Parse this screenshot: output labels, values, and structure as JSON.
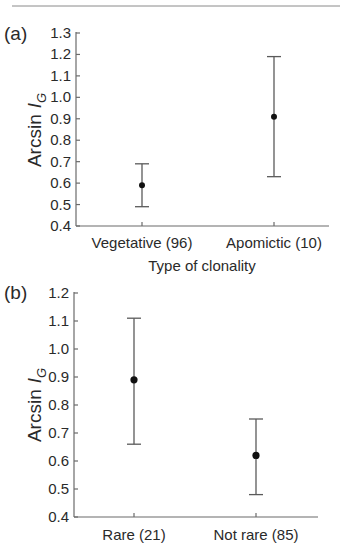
{
  "chart_data": [
    {
      "type": "scatter",
      "panel_label": "(a)",
      "title": "",
      "xlabel": "Type of clonality",
      "ylabel": "Arcsin",
      "ylabel_subscript_symbol": "I",
      "ylabel_subscript": "G",
      "categories": [
        "Vegetative (96)",
        "Apomictic (10)"
      ],
      "series": [
        {
          "name": "mean with interval",
          "values": [
            0.59,
            0.91
          ],
          "lower": [
            0.49,
            0.63
          ],
          "upper": [
            0.69,
            1.19
          ]
        }
      ],
      "ylim": [
        0.4,
        1.3
      ],
      "yticks": [
        "0.4",
        "0.5",
        "0.6",
        "0.7",
        "0.8",
        "0.9",
        "1.0",
        "1.1",
        "1.2",
        "1.3"
      ],
      "grid": false,
      "legend": "none"
    },
    {
      "type": "scatter",
      "panel_label": "(b)",
      "title": "",
      "xlabel": "",
      "ylabel": "Arcsin",
      "ylabel_subscript_symbol": "I",
      "ylabel_subscript": "G",
      "categories": [
        "Rare (21)",
        "Not rare (85)"
      ],
      "series": [
        {
          "name": "mean with interval",
          "values": [
            0.89,
            0.62
          ],
          "lower": [
            0.66,
            0.48
          ],
          "upper": [
            1.11,
            0.75
          ]
        }
      ],
      "ylim": [
        0.4,
        1.2
      ],
      "yticks": [
        "0.4",
        "0.5",
        "0.6",
        "0.7",
        "0.8",
        "0.9",
        "1.0",
        "1.1",
        "1.2"
      ],
      "grid": false,
      "legend": "none"
    }
  ]
}
